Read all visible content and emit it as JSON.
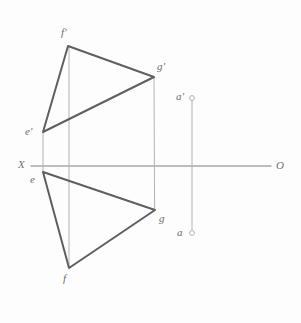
{
  "figure": {
    "type": "descriptive-geometry-projection",
    "background_color": "#fdfdfd",
    "canvas": {
      "width": 301,
      "height": 323
    }
  },
  "colors": {
    "triangle_stroke": "#5f5f5f",
    "projector_stroke": "#b2b2b2",
    "axis_stroke": "#a8a8a8",
    "label_text": "#6b6b6b",
    "axis_label_text": "#737373",
    "point_marker_stroke": "#b2b2b2",
    "point_marker_fill": "#fdfdfd"
  },
  "axis": {
    "name": "ground-line",
    "start_label": "X",
    "end_label": "O",
    "y": 166,
    "x_start": 31,
    "x_end": 271,
    "start_label_pos": {
      "x": 18,
      "y": 159
    },
    "end_label_pos": {
      "x": 276,
      "y": 161
    }
  },
  "points": [
    {
      "id": "f_prime",
      "label": "f'",
      "x": 68,
      "y": 46,
      "label_x": 61,
      "label_y": 27,
      "view": "frontal"
    },
    {
      "id": "g_prime",
      "label": "g'",
      "x": 154,
      "y": 77,
      "label_x": 157,
      "label_y": 61,
      "view": "frontal"
    },
    {
      "id": "e_prime",
      "label": "e'",
      "x": 43,
      "y": 132,
      "label_x": 25,
      "label_y": 126,
      "view": "frontal"
    },
    {
      "id": "e",
      "label": "e",
      "x": 43,
      "y": 172,
      "label_x": 30,
      "label_y": 174,
      "view": "horizontal"
    },
    {
      "id": "g",
      "label": "g",
      "x": 155,
      "y": 210,
      "label_x": 159,
      "label_y": 213,
      "view": "horizontal"
    },
    {
      "id": "f",
      "label": "f",
      "x": 69,
      "y": 268,
      "label_x": 63,
      "label_y": 273,
      "view": "horizontal"
    },
    {
      "id": "a_prime",
      "label": "a'",
      "x": 192,
      "y": 98,
      "label_x": 176,
      "label_y": 91,
      "view": "frontal",
      "marker": "circle"
    },
    {
      "id": "a",
      "label": "a",
      "x": 192,
      "y": 233,
      "label_x": 177,
      "label_y": 227,
      "view": "horizontal",
      "marker": "circle"
    }
  ],
  "triangles": [
    {
      "id": "frontal-view-triangle",
      "name": "triangle-e-prime-f-prime-g-prime",
      "vertices": [
        "f_prime",
        "g_prime",
        "e_prime"
      ],
      "path": "68,46 154,77 43,132 68,46"
    },
    {
      "id": "horizontal-view-triangle",
      "name": "triangle-e-f-g",
      "vertices": [
        "e",
        "g",
        "f"
      ],
      "path": "43,172 155,210 69,268 43,172"
    }
  ],
  "projectors": [
    {
      "id": "projector-e",
      "name": "projector-line-e",
      "x": 43,
      "y1": 132,
      "y2": 172
    },
    {
      "id": "projector-f",
      "name": "projector-line-f",
      "x": 69,
      "y1": 46,
      "y2": 268
    },
    {
      "id": "projector-g",
      "name": "projector-line-g",
      "x": 154,
      "y1": 77,
      "y2": 210
    },
    {
      "id": "projector-a",
      "name": "projector-line-a",
      "x": 192,
      "y1": 98,
      "y2": 233
    }
  ],
  "labels": {
    "f_prime": "f'",
    "g_prime": "g'",
    "e_prime": "e'",
    "e": "e",
    "g": "g",
    "f": "f",
    "a_prime": "a'",
    "a": "a",
    "x_axis": "X",
    "o_axis": "O"
  }
}
